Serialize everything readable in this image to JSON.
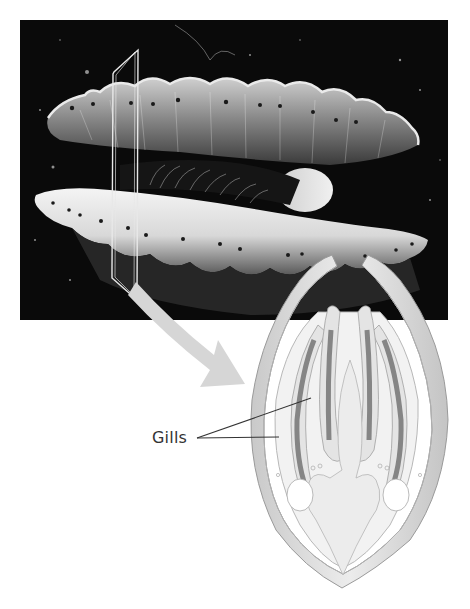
{
  "figure": {
    "photo": {
      "subject": "scallop",
      "description": "Photograph of an open scallop shell against a dark background with section plane overlay"
    },
    "section_plane": {
      "description": "Cross-section cutting plane outline"
    },
    "arrow": {
      "description": "Arrow pointing from section plane to cross-section diagram"
    },
    "cross_section": {
      "description": "Cross-sectional drawing of the scallop showing shell valves, gills and visceral mass"
    },
    "labels": [
      {
        "text": "Gills"
      }
    ]
  },
  "colors": {
    "photo_bg": "#0a0a0a",
    "shell_light": "#e6e6e6",
    "shell_mid": "#bdbdbd",
    "gill_dark": "#8c8c8c",
    "arrow": "#d4d4d4",
    "leader_line": "#333333"
  }
}
